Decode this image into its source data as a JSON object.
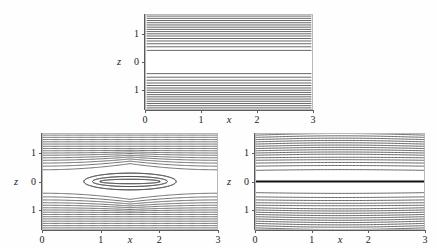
{
  "figure": {
    "background_color": "#fefefe",
    "line_color": "#4a4a4a",
    "frame_color": "#b9b9b9",
    "axis_color": "#5b5b5b"
  },
  "chart_data": [
    {
      "type": "line",
      "name": "top-panel",
      "title": "",
      "xlabel": "x",
      "ylabel": "z",
      "xlim": [
        0,
        3
      ],
      "ylim": [
        -1.7,
        1.7
      ],
      "xticks": [
        0,
        1,
        2,
        3
      ],
      "xticklabels": [
        "0",
        "1",
        "2",
        "3"
      ],
      "yticks": [
        1,
        0,
        -1
      ],
      "yticklabels": [
        "1",
        "0",
        "1"
      ],
      "grid": false,
      "legend": "none",
      "description": "Contour plot of straight horizontal level curves; contours crowd together near the top and bottom edges and spread apart leaving a white band around z = 0.",
      "contour_levels_z": [
        1.66,
        1.58,
        1.5,
        1.42,
        1.34,
        1.26,
        1.18,
        1.1,
        1.02,
        0.94,
        0.85,
        0.76,
        0.66,
        0.55,
        0.42,
        -0.42,
        -0.55,
        -0.66,
        -0.76,
        -0.85,
        -0.94,
        -1.02,
        -1.1,
        -1.18,
        -1.26,
        -1.34,
        -1.42,
        -1.5,
        -1.58,
        -1.66
      ],
      "emphasized_level_z": null,
      "curvature": "flat"
    },
    {
      "type": "line",
      "name": "bottom-left-panel",
      "title": "",
      "xlabel": "x",
      "ylabel": "z",
      "xlim": [
        0,
        3
      ],
      "ylim": [
        -1.7,
        1.7
      ],
      "xticks": [
        0,
        1,
        2,
        3
      ],
      "xticklabels": [
        "0",
        "1",
        "2",
        "3"
      ],
      "yticks": [
        1,
        0,
        -1
      ],
      "yticklabels": [
        "1",
        "0",
        "1"
      ],
      "grid": false,
      "legend": "none",
      "description": "Saddle / hyperbolic contour pattern: nested C-shaped curves open toward the left edge and toward the right edge, pinching together near x = 1.5, z = 0, where a white lens-shaped region separates them.",
      "saddle_point": [
        1.5,
        0
      ],
      "contour_levels_z": [
        1.66,
        1.58,
        1.5,
        1.42,
        1.34,
        1.26,
        1.18,
        1.1,
        1.02,
        0.94,
        0.85,
        0.76,
        0.66,
        0.55,
        0.42,
        0.3,
        0.18,
        0.08,
        -0.08,
        -0.18,
        -0.3,
        -0.42,
        -0.55,
        -0.66,
        -0.76,
        -0.85,
        -0.94,
        -1.02,
        -1.1,
        -1.18,
        -1.26,
        -1.34,
        -1.42,
        -1.5,
        -1.58,
        -1.66
      ],
      "emphasized_level_z": null,
      "curvature": "hyperbolic"
    },
    {
      "type": "line",
      "name": "bottom-right-panel",
      "title": "",
      "xlabel": "x",
      "ylabel": "z",
      "xlim": [
        0,
        3
      ],
      "ylim": [
        -1.7,
        1.7
      ],
      "xticks": [
        0,
        1,
        2,
        3
      ],
      "xticklabels": [
        "0",
        "1",
        "2",
        "3"
      ],
      "yticks": [
        1,
        0,
        -1
      ],
      "yticklabels": [
        "1",
        "0",
        "1"
      ],
      "grid": false,
      "legend": "none",
      "description": "Nearly horizontal contours crowding toward the top and bottom edges, with a single thick dark contour lying exactly on z = 0 and narrow white bands just above and below it.",
      "contour_levels_z": [
        1.66,
        1.58,
        1.5,
        1.42,
        1.34,
        1.26,
        1.18,
        1.1,
        1.02,
        0.94,
        0.85,
        0.76,
        0.66,
        0.55,
        0.4,
        0,
        -0.4,
        -0.55,
        -0.66,
        -0.76,
        -0.85,
        -0.94,
        -1.02,
        -1.1,
        -1.18,
        -1.26,
        -1.34,
        -1.42,
        -1.5,
        -1.58,
        -1.66
      ],
      "emphasized_level_z": 0,
      "curvature": "slightly-bowed"
    }
  ],
  "panels": [
    {
      "id": "top",
      "xlabel": "x",
      "ylabel": "z",
      "xticklabels": [
        "0",
        "1",
        "2",
        "3"
      ],
      "yticklabels": [
        "1",
        "0",
        "1"
      ]
    },
    {
      "id": "bottom-left",
      "xlabel": "x",
      "ylabel": "z",
      "xticklabels": [
        "0",
        "1",
        "2",
        "3"
      ],
      "yticklabels": [
        "1",
        "0",
        "1"
      ]
    },
    {
      "id": "bottom-right",
      "xlabel": "x",
      "ylabel": "z",
      "xticklabels": [
        "0",
        "1",
        "2",
        "3"
      ],
      "yticklabels": [
        "1",
        "0",
        "1"
      ]
    }
  ]
}
